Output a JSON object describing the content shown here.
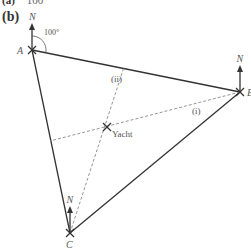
{
  "part_a": {
    "label": "(a)",
    "value": "100"
  },
  "part_b": {
    "label": "(b)"
  },
  "points": {
    "A": {
      "label": "A",
      "x": 32,
      "y": 50
    },
    "B": {
      "label": "B",
      "x": 240,
      "y": 92
    },
    "C": {
      "label": "C",
      "x": 70,
      "y": 233
    },
    "yacht": {
      "label": "Yacht",
      "x": 107,
      "y": 127
    }
  },
  "north_label": "N",
  "bearing_label": "100°",
  "lines": {
    "i": {
      "label": "(i)"
    },
    "ii": {
      "label": "(ii)"
    }
  },
  "colors": {
    "solid": "#333333",
    "dashed": "#888888",
    "text": "#555555"
  }
}
